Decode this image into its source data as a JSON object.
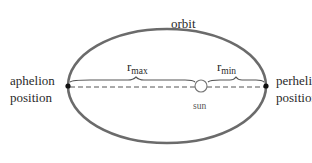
{
  "diagram": {
    "labels": {
      "orbit": "orbit",
      "aphelion": [
        "aphelion",
        "position"
      ],
      "perihelion": [
        "perhelion",
        "position"
      ],
      "sun": "sun",
      "r_max": {
        "base": "r",
        "sub": "max"
      },
      "r_min": {
        "base": "r",
        "sub": "min"
      }
    },
    "colors": {
      "orbit_stroke": "#6b6b6b",
      "dash_line": "#555555",
      "brace": "#555555",
      "dot": "#111111",
      "sun_fill": "#ffffff",
      "sun_stroke": "#777777",
      "text": "#2a2a2a"
    },
    "geometry": {
      "ellipse": {
        "cx": 167,
        "cy": 86,
        "rx": 99,
        "ry": 57
      },
      "aphelion_point": {
        "x": 68,
        "y": 86
      },
      "perihelion_point": {
        "x": 266,
        "y": 86
      },
      "sun": {
        "x": 201,
        "y": 86,
        "r": 6
      }
    }
  }
}
